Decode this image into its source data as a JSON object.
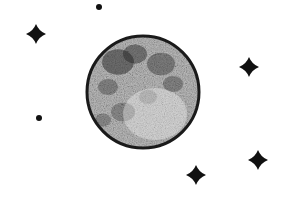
{
  "scene": {
    "description": "Full moon with stars",
    "background": "#ffffff",
    "ink": "#111111",
    "moon": {
      "cx": 143,
      "cy": 92,
      "r": 56,
      "outline": "#1a1a1a",
      "fill": "#bdbdbd"
    },
    "stars": [
      {
        "x": 36,
        "y": 34,
        "size": 10
      },
      {
        "x": 249,
        "y": 67,
        "size": 10
      },
      {
        "x": 196,
        "y": 175,
        "size": 10
      },
      {
        "x": 258,
        "y": 160,
        "size": 10
      }
    ],
    "dots": [
      {
        "x": 99,
        "y": 7,
        "r": 3
      },
      {
        "x": 39,
        "y": 118,
        "r": 3
      }
    ]
  }
}
